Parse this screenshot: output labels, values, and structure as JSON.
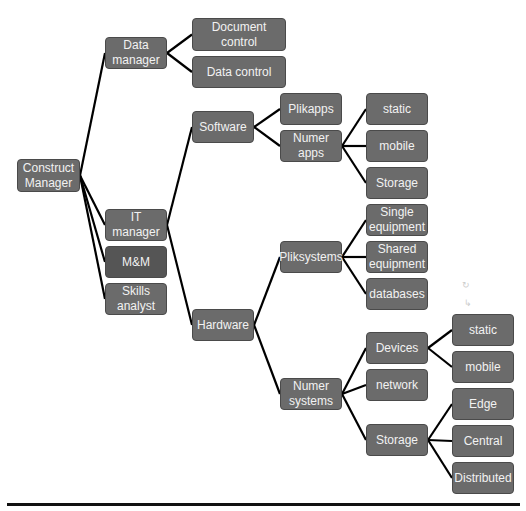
{
  "diagram": {
    "colors": {
      "node": "#6b6b6b",
      "node_dark": "#555555",
      "line": "#000000",
      "text": "#f2f2f2"
    },
    "nodes": [
      {
        "id": "root",
        "label": "Construct\nManager",
        "x": 17,
        "y": 159,
        "w": 63,
        "h": 33
      },
      {
        "id": "dm",
        "label": "Data\nmanager",
        "x": 105,
        "y": 37,
        "w": 62,
        "h": 32
      },
      {
        "id": "doc",
        "label": "Document\ncontrol",
        "x": 192,
        "y": 18,
        "w": 94,
        "h": 33
      },
      {
        "id": "datac",
        "label": "Data control",
        "x": 192,
        "y": 56,
        "w": 94,
        "h": 32
      },
      {
        "id": "it",
        "label": "IT\nmanager",
        "x": 105,
        "y": 209,
        "w": 62,
        "h": 32
      },
      {
        "id": "mm",
        "label": "M&M",
        "x": 105,
        "y": 246,
        "w": 62,
        "h": 32,
        "dark": true
      },
      {
        "id": "skills",
        "label": "Skills\nanalyst",
        "x": 105,
        "y": 283,
        "w": 62,
        "h": 32
      },
      {
        "id": "sw",
        "label": "Software",
        "x": 192,
        "y": 111,
        "w": 62,
        "h": 32
      },
      {
        "id": "hw",
        "label": "Hardware",
        "x": 192,
        "y": 309,
        "w": 62,
        "h": 32
      },
      {
        "id": "plikapps",
        "label": "Plikapps",
        "x": 280,
        "y": 93,
        "w": 62,
        "h": 32
      },
      {
        "id": "numapps",
        "label": "Numer\napps",
        "x": 280,
        "y": 130,
        "w": 62,
        "h": 32
      },
      {
        "id": "static1",
        "label": "static",
        "x": 366,
        "y": 93,
        "w": 62,
        "h": 32
      },
      {
        "id": "mobile1",
        "label": "mobile",
        "x": 366,
        "y": 130,
        "w": 62,
        "h": 32
      },
      {
        "id": "storage1",
        "label": "Storage",
        "x": 366,
        "y": 167,
        "w": 62,
        "h": 32
      },
      {
        "id": "pliksys",
        "label": "Pliksystems",
        "x": 280,
        "y": 241,
        "w": 62,
        "h": 32
      },
      {
        "id": "single",
        "label": "Single\nequipment",
        "x": 366,
        "y": 204,
        "w": 62,
        "h": 32
      },
      {
        "id": "shared",
        "label": "Shared\nequipment",
        "x": 366,
        "y": 241,
        "w": 62,
        "h": 32
      },
      {
        "id": "db",
        "label": "databases",
        "x": 366,
        "y": 278,
        "w": 62,
        "h": 32
      },
      {
        "id": "numsys",
        "label": "Numer\nsystems",
        "x": 280,
        "y": 378,
        "w": 62,
        "h": 32
      },
      {
        "id": "devices",
        "label": "Devices",
        "x": 366,
        "y": 332,
        "w": 62,
        "h": 32
      },
      {
        "id": "network",
        "label": "network",
        "x": 366,
        "y": 369,
        "w": 62,
        "h": 32
      },
      {
        "id": "storage2",
        "label": "Storage",
        "x": 366,
        "y": 424,
        "w": 62,
        "h": 32
      },
      {
        "id": "static2",
        "label": "static",
        "x": 452,
        "y": 314,
        "w": 62,
        "h": 32
      },
      {
        "id": "mobile2",
        "label": "mobile",
        "x": 452,
        "y": 351,
        "w": 62,
        "h": 32
      },
      {
        "id": "edge",
        "label": "Edge",
        "x": 452,
        "y": 388,
        "w": 62,
        "h": 32
      },
      {
        "id": "central",
        "label": "Central",
        "x": 452,
        "y": 425,
        "w": 62,
        "h": 32
      },
      {
        "id": "distributed",
        "label": "Distributed",
        "x": 452,
        "y": 462,
        "w": 62,
        "h": 32
      }
    ],
    "edges": [
      [
        "root",
        "dm"
      ],
      [
        "root",
        "it"
      ],
      [
        "root",
        "mm"
      ],
      [
        "root",
        "skills"
      ],
      [
        "dm",
        "doc"
      ],
      [
        "dm",
        "datac"
      ],
      [
        "it",
        "sw"
      ],
      [
        "it",
        "hw"
      ],
      [
        "sw",
        "plikapps"
      ],
      [
        "sw",
        "numapps"
      ],
      [
        "numapps",
        "static1"
      ],
      [
        "numapps",
        "mobile1"
      ],
      [
        "numapps",
        "storage1"
      ],
      [
        "hw",
        "pliksys"
      ],
      [
        "hw",
        "numsys"
      ],
      [
        "pliksys",
        "single"
      ],
      [
        "pliksys",
        "shared"
      ],
      [
        "pliksys",
        "db"
      ],
      [
        "numsys",
        "devices"
      ],
      [
        "numsys",
        "network"
      ],
      [
        "numsys",
        "storage2"
      ],
      [
        "devices",
        "static2"
      ],
      [
        "devices",
        "mobile2"
      ],
      [
        "storage2",
        "edge"
      ],
      [
        "storage2",
        "central"
      ],
      [
        "storage2",
        "distributed"
      ]
    ]
  }
}
